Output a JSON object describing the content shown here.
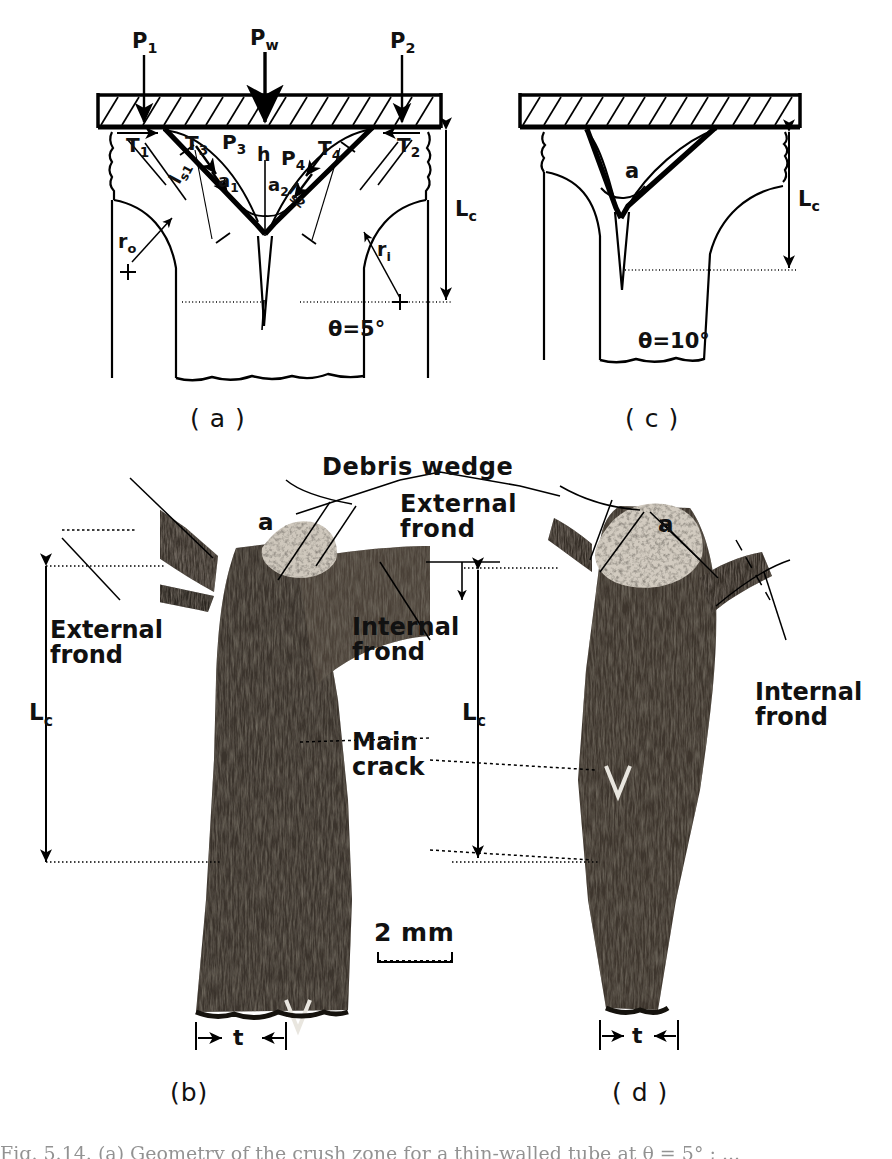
{
  "figure": {
    "kind": "scientific-figure",
    "panels": [
      "a",
      "b",
      "c",
      "d"
    ],
    "captions": {
      "a": "( a )",
      "b": "(b)",
      "c": "( c )",
      "d": "( d )"
    },
    "bottom_caption_partial": "Fig. 5.14. (a) Geometry of the crush zone for a thin-walled tube at θ = 5° ; ..."
  },
  "panel_a": {
    "label": "( a )",
    "theta": "θ=5°",
    "loads": [
      {
        "name": "P1",
        "base": "P",
        "sub": "1"
      },
      {
        "name": "Pw",
        "base": "P",
        "sub": "w"
      },
      {
        "name": "P2",
        "base": "P",
        "sub": "2"
      },
      {
        "name": "P3",
        "base": "P",
        "sub": "3"
      },
      {
        "name": "P4",
        "base": "P",
        "sub": "4"
      }
    ],
    "tractions": [
      {
        "name": "T1",
        "base": "T",
        "sub": "1"
      },
      {
        "name": "T2",
        "base": "T",
        "sub": "2"
      },
      {
        "name": "T3",
        "base": "T",
        "sub": "3"
      },
      {
        "name": "T4",
        "base": "T",
        "sub": "4"
      }
    ],
    "angles": [
      {
        "name": "a1",
        "base": "a",
        "sub": "1"
      },
      {
        "name": "a2",
        "base": "a",
        "sub": "2"
      }
    ],
    "lengths": [
      {
        "name": "ls1",
        "base": "l",
        "sub": "s1"
      },
      {
        "name": "ls2",
        "base": "l",
        "sub": "s2"
      },
      {
        "name": "h",
        "base": "h",
        "sub": ""
      },
      {
        "name": "Lc",
        "base": "L",
        "sub": "c"
      }
    ],
    "radii": [
      {
        "name": "ro",
        "base": "r",
        "sub": "o"
      },
      {
        "name": "ri",
        "base": "r",
        "sub": "i"
      }
    ]
  },
  "panel_c": {
    "label": "( c )",
    "theta": "θ=10°",
    "angle_label": {
      "base": "a",
      "sub": ""
    },
    "length_label": {
      "base": "L",
      "sub": "c"
    }
  },
  "panel_b": {
    "label": "(b)",
    "annotations": [
      {
        "id": "external-frond",
        "line1": "External",
        "line2": "frond"
      },
      {
        "id": "internal-frond",
        "line1": "Internal",
        "line2": "frond"
      },
      {
        "id": "main-crack",
        "line1": "Main",
        "line2": "crack"
      },
      {
        "id": "angle-a",
        "line1": "a",
        "line2": ""
      }
    ],
    "dimensions": [
      {
        "name": "Lc",
        "base": "L",
        "sub": "c"
      },
      {
        "name": "t",
        "base": "t",
        "sub": ""
      }
    ]
  },
  "panel_d": {
    "label": "( d )",
    "annotations": [
      {
        "id": "internal-frond",
        "line1": "Internal",
        "line2": "frond"
      },
      {
        "id": "angle-a",
        "line1": "a",
        "line2": ""
      }
    ],
    "dimensions": [
      {
        "name": "Lc",
        "base": "L",
        "sub": "c"
      },
      {
        "name": "t",
        "base": "t",
        "sub": ""
      }
    ]
  },
  "shared_labels": {
    "debris_wedge": "Debris wedge",
    "external_frond_l1": "External",
    "external_frond_l2": "frond",
    "scale_bar": "2 mm"
  },
  "colors": {
    "ink": "#000000",
    "paper": "#ffffff",
    "photo_dark": "#2b2620",
    "photo_mid": "#554d44",
    "photo_light": "#8d8377"
  }
}
